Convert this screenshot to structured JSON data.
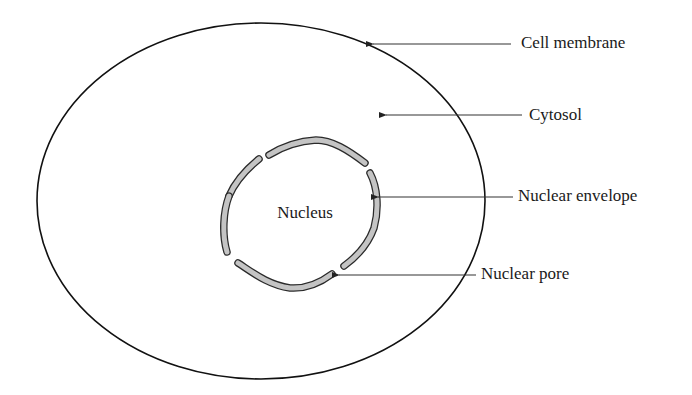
{
  "diagram": {
    "type": "cell-structure",
    "colors": {
      "background": "#ffffff",
      "outline": "#111111",
      "envelope_fill": "#c4c4c4",
      "envelope_stroke": "#2a2a2a",
      "text": "#1a1a1a"
    },
    "center_label": "Nucleus",
    "labels": [
      {
        "id": "cell-membrane",
        "text": "Cell membrane"
      },
      {
        "id": "cytosol",
        "text": "Cytosol"
      },
      {
        "id": "nuclear-envelope",
        "text": "Nuclear envelope"
      },
      {
        "id": "nuclear-pore",
        "text": "Nuclear pore"
      }
    ]
  }
}
